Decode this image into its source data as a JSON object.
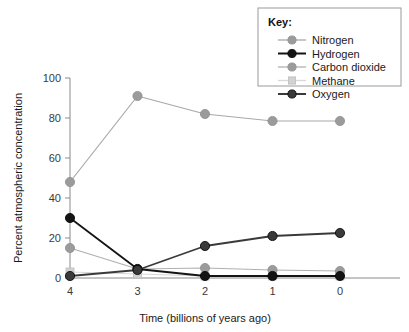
{
  "chart_data": {
    "type": "line",
    "title": "",
    "xlabel": "Time (billions of years ago)",
    "ylabel": "Percent atmospheric concentration",
    "x": [
      4,
      3,
      2,
      1,
      0
    ],
    "xticklabels": [
      "4",
      "3",
      "2",
      "1",
      "0"
    ],
    "yticklabels": [
      "0",
      "20",
      "40",
      "60",
      "80",
      "100"
    ],
    "yticks": [
      0,
      20,
      40,
      60,
      80,
      100
    ],
    "xlim": [
      4,
      0
    ],
    "ylim": [
      0,
      100
    ],
    "grid": false,
    "legend_position": "top-right",
    "legend_title": "Key:",
    "series": [
      {
        "name": "Nitrogen",
        "values": [
          48,
          91,
          82,
          78.5,
          78.5
        ],
        "color": "#9b9b9b",
        "marker": "circle",
        "line_color": "#a8a8a8"
      },
      {
        "name": "Hydrogen",
        "values": [
          30,
          4.5,
          1,
          1,
          1
        ],
        "color": "#141414",
        "marker": "circle",
        "line_color": "#141414"
      },
      {
        "name": "Carbon dioxide",
        "values": [
          15,
          4.5,
          5,
          4,
          3.5
        ],
        "color": "#9b9b9b",
        "marker": "circle",
        "line_color": "#b0b0b0"
      },
      {
        "name": "Methane",
        "values": [
          3,
          2,
          1,
          1,
          1
        ],
        "color": "#d2d2d2",
        "marker": "square",
        "line_color": "#d8d8d8"
      },
      {
        "name": "Oxygen",
        "values": [
          1,
          4,
          16,
          21,
          22.5
        ],
        "color": "#3a3a3a",
        "marker": "circle",
        "line_color": "#3a3a3a"
      }
    ]
  },
  "legend": {
    "title": "Key:",
    "items": [
      {
        "label": "Nitrogen"
      },
      {
        "label": "Hydrogen"
      },
      {
        "label": "Carbon dioxide"
      },
      {
        "label": "Methane"
      },
      {
        "label": "Oxygen"
      }
    ]
  },
  "axes": {
    "x_title": "Time (billions of years ago)",
    "y_title": "Percent atmospheric concentration"
  }
}
